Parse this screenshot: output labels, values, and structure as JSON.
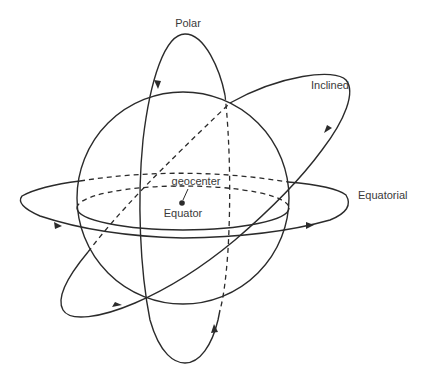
{
  "diagram": {
    "type": "orbit-types",
    "labels": {
      "polar": "Polar",
      "inclined": "Inclined",
      "equatorial": "Equatorial",
      "geocenter": "geocenter",
      "equator": "Equator"
    },
    "colors": {
      "line": "#2b2b2b",
      "text": "#3a3a3a",
      "background": "#ffffff"
    },
    "orbits": [
      "Polar",
      "Inclined",
      "Equatorial"
    ]
  }
}
